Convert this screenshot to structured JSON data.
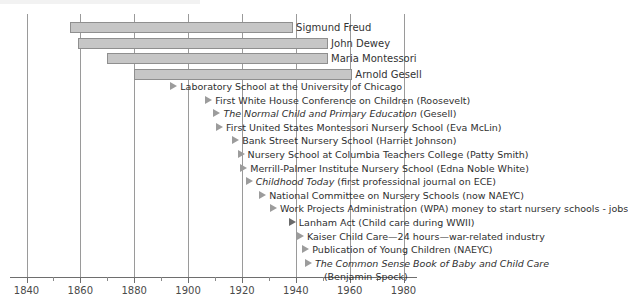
{
  "chart_data": {
    "type": "bar",
    "title": "",
    "xlabel": "",
    "ylabel": "",
    "xlim": [
      1840,
      1985
    ],
    "grid": true,
    "legend_position": "none",
    "axis": {
      "major_ticks": [
        1840,
        1860,
        1880,
        1900,
        1920,
        1940,
        1960,
        1980
      ],
      "major_tick_labels": [
        "1840",
        "1860",
        "1880",
        "1900",
        "1920",
        "1940",
        "1960",
        "1980"
      ],
      "minor_ticks": [
        1850,
        1870,
        1890,
        1910,
        1930,
        1950,
        1970
      ],
      "gridline_years": [
        1840,
        1860,
        1880,
        1900,
        1920,
        1940,
        1960,
        1980
      ]
    },
    "lifespan_bars": [
      {
        "label": "Sigmund Freud",
        "start": 1856,
        "end": 1939
      },
      {
        "label": "John Dewey",
        "start": 1859,
        "end": 1952
      },
      {
        "label": "Maria Montessori",
        "start": 1870,
        "end": 1952
      },
      {
        "label": "Arnold Gesell",
        "start": 1880,
        "end": 1961
      }
    ],
    "events": [
      {
        "year": 1896,
        "text": "Laboratory School at the University of Chicago",
        "italic": false,
        "italic_part": "",
        "marker": "open"
      },
      {
        "year": 1909,
        "text": "First White House Conference on Children (Roosevelt)",
        "italic": false,
        "italic_part": "",
        "marker": "open"
      },
      {
        "year": 1912,
        "text": "The Normal Child and Primary Education (Gesell)",
        "italic": true,
        "italic_part": "The Normal Child and Primary Education",
        "marker": "open"
      },
      {
        "year": 1913,
        "text": "First United States Montessori Nursery School (Eva McLin)",
        "italic": false,
        "italic_part": "",
        "marker": "open"
      },
      {
        "year": 1919,
        "text": "Bank Street Nursery School (Harriet Johnson)",
        "italic": false,
        "italic_part": "",
        "marker": "open"
      },
      {
        "year": 1921,
        "text": "Nursery School at Columbia Teachers College (Patty Smith)",
        "italic": false,
        "italic_part": "",
        "marker": "open"
      },
      {
        "year": 1922,
        "text": "Merrill-Palmer Institute Nursery School (Edna Noble White)",
        "italic": false,
        "italic_part": "",
        "marker": "open"
      },
      {
        "year": 1924,
        "text": "Childhood Today (first professional journal on ECE)",
        "italic": true,
        "italic_part": "Childhood Today",
        "marker": "open"
      },
      {
        "year": 1929,
        "text": "National Committee on Nursery Schools (now NAEYC)",
        "italic": false,
        "italic_part": "",
        "marker": "open"
      },
      {
        "year": 1933,
        "text": "Work Projects Administration (WPA) money to start nursery schools - jobs",
        "italic": false,
        "italic_part": "",
        "marker": "open"
      },
      {
        "year": 1940,
        "text": "Lanham Act (Child care during WWII)",
        "italic": false,
        "italic_part": "",
        "marker": "filled"
      },
      {
        "year": 1943,
        "text": "Kaiser Child Care—24 hours—war-related industry",
        "italic": false,
        "italic_part": "",
        "marker": "open"
      },
      {
        "year": 1945,
        "text": "Publication of Young Children (NAEYC)",
        "italic": false,
        "italic_part": "",
        "marker": "open"
      },
      {
        "year": 1946,
        "text": "The Common Sense Book of Baby and Child Care",
        "italic": true,
        "italic_part": "The Common Sense Book of Baby and Child Care",
        "marker": "open",
        "continuation": "(Benjamin Spock)"
      }
    ]
  }
}
